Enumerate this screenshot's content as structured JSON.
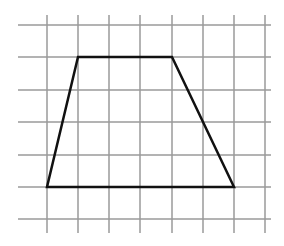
{
  "diagram": {
    "type": "grid-with-polygon",
    "grid": {
      "vertical_lines_x": [
        47,
        78,
        109,
        140,
        172,
        203,
        234,
        265
      ],
      "horizontal_lines_y": [
        25,
        57,
        90,
        122,
        155,
        187,
        219
      ],
      "h_extent": [
        18,
        271
      ],
      "v_extent": [
        15,
        233
      ],
      "color": "#9a9a9a",
      "stroke_width": 1.5
    },
    "shape": {
      "name": "trapezoid",
      "vertices": [
        [
          78,
          57
        ],
        [
          172,
          57
        ],
        [
          234,
          187
        ],
        [
          47,
          187
        ]
      ],
      "grid_units": {
        "top_base": 3,
        "bottom_base": 6,
        "height": 4
      },
      "color": "#111111",
      "stroke_width": 2.5
    }
  }
}
